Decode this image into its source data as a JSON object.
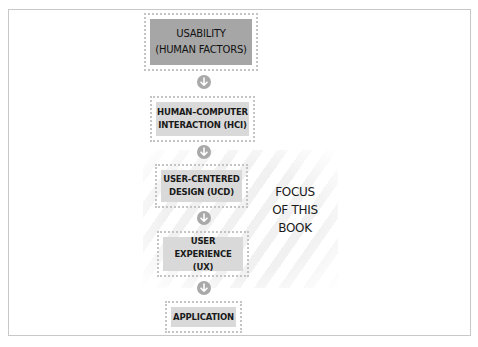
{
  "diagram": {
    "type": "vertical-flow",
    "nodes": [
      {
        "id": "usability",
        "label": "USABILITY\n(HUMAN FACTORS)",
        "style": "dark"
      },
      {
        "id": "hci",
        "label": "HUMAN–COMPUTER\nINTERACTION (HCI)",
        "style": "light"
      },
      {
        "id": "ucd",
        "label": "USER-CENTERED\nDESIGN (UCD)",
        "style": "light"
      },
      {
        "id": "ux",
        "label": "USER EXPERIENCE\n(UX)",
        "style": "light"
      },
      {
        "id": "application",
        "label": "APPLICATION",
        "style": "light"
      }
    ],
    "edges": [
      {
        "from": "usability",
        "to": "hci",
        "icon": "arrow-down-circle-icon"
      },
      {
        "from": "hci",
        "to": "ucd",
        "icon": "arrow-down-circle-icon"
      },
      {
        "from": "ucd",
        "to": "ux",
        "icon": "arrow-down-circle-icon"
      },
      {
        "from": "ux",
        "to": "application",
        "icon": "arrow-down-circle-icon"
      }
    ],
    "highlight": {
      "label": "FOCUS\nOF THIS\nBOOK",
      "covers": [
        "ucd",
        "ux"
      ],
      "pattern": "diagonal-stripes"
    },
    "colors": {
      "dark_fill": "#a6a6a6",
      "light_fill": "#d9d9d9",
      "dotted_border": "#c4c4c4",
      "arrow_circle": "#a9a9a9",
      "stripe": "#f1f1f1",
      "frame_border": "#c8c8c8"
    }
  }
}
